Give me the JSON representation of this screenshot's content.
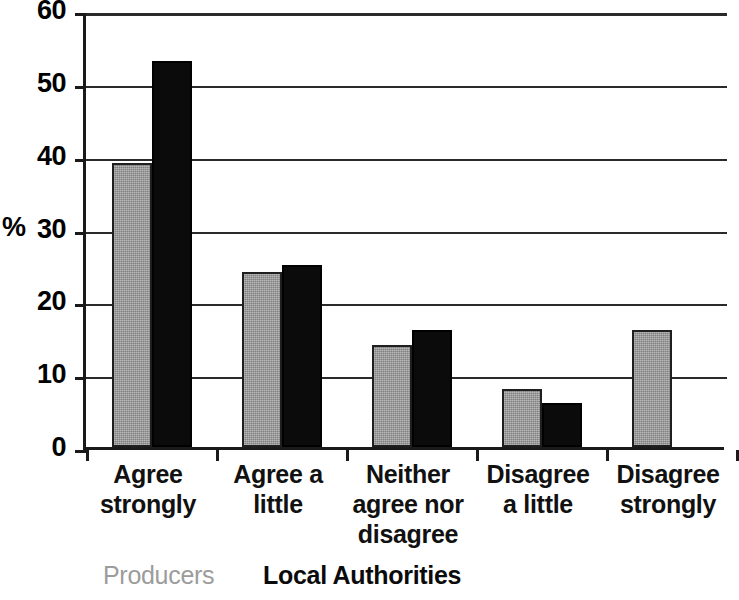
{
  "chart_data": {
    "type": "bar",
    "title": "",
    "subtitle": "",
    "xlabel": "",
    "ylabel": "%",
    "ylim": [
      0,
      60
    ],
    "ytick_values": [
      60,
      50,
      40,
      30,
      20,
      10,
      0
    ],
    "ytick_labels": [
      "60",
      "50",
      "40",
      "30",
      "20",
      "10",
      "0"
    ],
    "ystep": 10,
    "grid": "horizontal",
    "legend_position": "bottom-left",
    "categories": [
      "Agree strongly",
      "Agree a little",
      "Neither agree nor disagree",
      "Disagree a little",
      "Disagree strongly"
    ],
    "category_lines": [
      [
        "Agree",
        "strongly"
      ],
      [
        "Agree a",
        "little"
      ],
      [
        "Neither",
        "agree nor",
        "disagree"
      ],
      [
        "Disagree",
        "a little"
      ],
      [
        "Disagree",
        "strongly"
      ]
    ],
    "series": [
      {
        "name": "Producers",
        "color": "#9c9c9c",
        "values": [
          39,
          24,
          14,
          8,
          16
        ]
      },
      {
        "name": "Local Authorities",
        "color": "#0b0b0b",
        "values": [
          53,
          25,
          16,
          6,
          0
        ]
      }
    ]
  },
  "axis": {
    "y_title": "%"
  },
  "legend": {
    "producers_label": "Producers",
    "authorities_label": "Local Authorities"
  }
}
